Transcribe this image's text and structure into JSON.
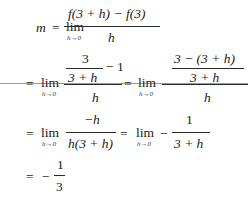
{
  "document": {
    "background": "#ffffff",
    "text_color": "#1a1a1a",
    "derivation": {
      "line1": {
        "lhs": "m",
        "eq": "=",
        "lim": "lim",
        "lim_sub": "h→0",
        "numerator": "f(3 + h) − f(3)",
        "denominator": "h"
      },
      "line2": {
        "eq1": "=",
        "lim1": "lim",
        "lim1_sub": "h→0",
        "inner_numerator": "3",
        "inner_denominator": "3 + h",
        "minus_one": "− 1",
        "denominator1": "h",
        "eq2": "=",
        "lim2": "lim",
        "lim2_sub": "h→0",
        "inner2_numerator": "3 − (3 + h)",
        "inner2_denominator": "3 + h",
        "denominator2": "h"
      },
      "line3": {
        "eq1": "=",
        "lim1": "lim",
        "lim1_sub": "h→0",
        "numerator1": "−h",
        "denominator1": "h(3 + h)",
        "eq2": "=",
        "lim2": "lim",
        "lim2_sub": "h→0",
        "minus": "−",
        "numerator2": "1",
        "denominator2": "3 + h"
      },
      "line4": {
        "eq": "=",
        "minus": "−",
        "numerator": "1",
        "denominator": "3"
      }
    }
  }
}
